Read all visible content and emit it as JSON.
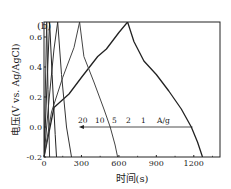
{
  "panel_label": "(b)",
  "chart_data": {
    "type": "line",
    "title": "",
    "xlabel": "时间(s)",
    "ylabel": "电压(V vs. Ag/AgCl)",
    "xlim": [
      0,
      1410
    ],
    "ylim": [
      -0.2,
      0.7
    ],
    "xticks": [
      0,
      300,
      600,
      900,
      1200
    ],
    "yticks": [
      -0.2,
      0.0,
      0.2,
      0.4,
      0.6
    ],
    "grid": false,
    "legend": "none",
    "annotation": {
      "labels": [
        "20",
        "10",
        "5",
        "2",
        "1",
        "A/g"
      ],
      "arrow": "points left (decreasing time with increasing current density)",
      "arrow_y": 0.0,
      "arrow_x_from": 1190,
      "arrow_x_to": 280
    },
    "series": [
      {
        "name": "1 A/g",
        "x": [
          0,
          80,
          200,
          300,
          430,
          500,
          600,
          670,
          720,
          800,
          900,
          1000,
          1100,
          1180,
          1230,
          1270
        ],
        "y": [
          -0.2,
          0.13,
          0.22,
          0.33,
          0.47,
          0.52,
          0.63,
          0.7,
          0.57,
          0.44,
          0.35,
          0.24,
          0.12,
          0.0,
          -0.1,
          -0.2
        ]
      },
      {
        "name": "2 A/g",
        "x": [
          0,
          60,
          150,
          240,
          285,
          320,
          400,
          480,
          530,
          570,
          590
        ],
        "y": [
          -0.2,
          0.1,
          0.33,
          0.53,
          0.7,
          0.47,
          0.3,
          0.12,
          0.0,
          -0.12,
          -0.2
        ]
      },
      {
        "name": "5 A/g",
        "x": [
          0,
          40,
          80,
          110,
          140,
          180,
          220
        ],
        "y": [
          -0.2,
          0.18,
          0.52,
          0.7,
          0.35,
          0.0,
          -0.2
        ]
      },
      {
        "name": "10 A/g",
        "x": [
          0,
          25,
          45,
          65,
          90,
          100
        ],
        "y": [
          -0.2,
          0.3,
          0.7,
          0.35,
          -0.05,
          -0.2
        ]
      },
      {
        "name": "20 A/g",
        "x": [
          0,
          12,
          22,
          32,
          45
        ],
        "y": [
          -0.2,
          0.3,
          0.7,
          0.25,
          -0.2
        ]
      }
    ]
  }
}
